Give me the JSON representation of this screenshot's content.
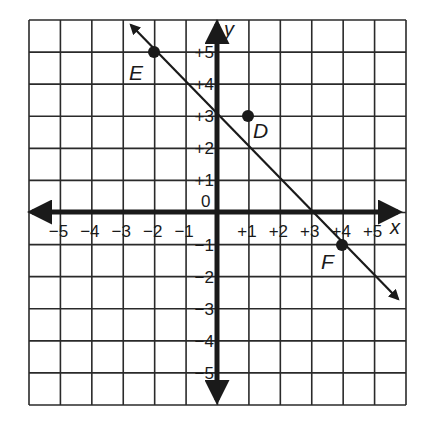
{
  "graph": {
    "x_axis_label": "x",
    "y_axis_label": "y",
    "origin_label": "0",
    "x_ticks": [
      "−5",
      "−4",
      "−3",
      "−2",
      "−1",
      "+1",
      "+2",
      "+3",
      "+4",
      "+5"
    ],
    "y_ticks_pos": [
      "+5",
      "+4",
      "+3",
      "+2",
      "+1"
    ],
    "y_ticks_neg": [
      "−1",
      "−2",
      "−3",
      "−4",
      "−5"
    ],
    "points": [
      {
        "label": "E",
        "x": -2,
        "y": 5
      },
      {
        "label": "D",
        "x": 1,
        "y": 3
      },
      {
        "label": "F",
        "x": 4,
        "y": -1
      }
    ],
    "line": {
      "equation": "y = -x + 3",
      "slope": -1,
      "intercept": 3
    },
    "colors": {
      "ink": "#1a1a1a",
      "grid": "#2a2a2a",
      "background": "#ffffff"
    }
  },
  "chart_data": {
    "type": "scatter",
    "title": "",
    "xlabel": "x",
    "ylabel": "y",
    "xlim": [
      -6,
      6
    ],
    "ylim": [
      -6,
      6
    ],
    "grid": true,
    "series": [
      {
        "name": "line",
        "kind": "line",
        "points": [
          [
            -2,
            5
          ],
          [
            4,
            -1
          ]
        ],
        "equation": "y = -x + 3"
      },
      {
        "name": "points",
        "kind": "scatter",
        "points": [
          {
            "label": "E",
            "x": -2,
            "y": 5
          },
          {
            "label": "D",
            "x": 1,
            "y": 3
          },
          {
            "label": "F",
            "x": 4,
            "y": -1
          }
        ]
      }
    ],
    "x_tick_labels": [
      "-5",
      "-4",
      "-3",
      "-2",
      "-1",
      "+1",
      "+2",
      "+3",
      "+4",
      "+5"
    ],
    "y_tick_labels": [
      "+5",
      "+4",
      "+3",
      "+2",
      "+1",
      "0",
      "-1",
      "-2",
      "-3",
      "-4",
      "-5"
    ]
  }
}
